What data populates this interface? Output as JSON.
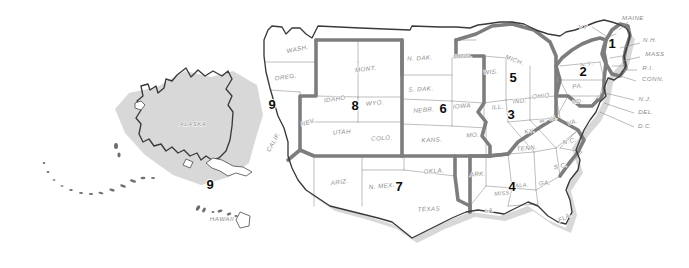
{
  "map": {
    "title": "United States Federal Regions Map",
    "background_color": "#ffffff",
    "region_boundary_color": "#7d7d7d",
    "state_border_color": "#9a9a9a",
    "coast_outline_color": "#3a3a3a",
    "label_color": "#8c8c8c",
    "number_color": "#0d0d0d",
    "lake_color": "#e3e3e3",
    "shadow_color": "#c9c9c9"
  },
  "regions": [
    {
      "number": "1",
      "x": 612,
      "y": 48,
      "states": [
        "MAINE",
        "VT",
        "N.H.",
        "MASS",
        "R.I.",
        "CONN."
      ]
    },
    {
      "number": "2",
      "x": 583,
      "y": 76,
      "states": [
        "N.Y.",
        "PA.",
        "N.J.",
        "DEL.",
        "MD."
      ]
    },
    {
      "number": "3",
      "x": 511,
      "y": 119,
      "states": [
        "W.VA.",
        "VA.",
        "KY.",
        "TENN.",
        "N.C.",
        "D.C."
      ]
    },
    {
      "number": "4",
      "x": 512,
      "y": 191,
      "states": [
        "ALA.",
        "MISS.",
        "GA.",
        "S.C.",
        "FLA.",
        "LA."
      ]
    },
    {
      "number": "5",
      "x": 513,
      "y": 82,
      "states": [
        "MICH.",
        "WIS.",
        "ILL.",
        "IND.",
        "OHIO"
      ]
    },
    {
      "number": "6",
      "x": 443,
      "y": 113,
      "states": [
        "MINN.",
        "N. DAK.",
        "S. DAK.",
        "NEBR.",
        "IOWA",
        "KANS.",
        "MO."
      ]
    },
    {
      "number": "7",
      "x": 399,
      "y": 191,
      "states": [
        "ARIZ.",
        "N. MEX.",
        "OKLA.",
        "TEXAS"
      ]
    },
    {
      "number": "8",
      "x": 355,
      "y": 110,
      "states": [
        "IDAHO",
        "WYO.",
        "NEV.",
        "UTAH",
        "COLO."
      ]
    },
    {
      "number": "9",
      "x": 272,
      "y": 109,
      "states": [
        "WASH.",
        "OREG.",
        "CALIF."
      ]
    },
    {
      "number": "9",
      "x": 210,
      "y": 189,
      "states": [
        "ALASKA",
        "HAWAII"
      ]
    }
  ],
  "state_labels": [
    {
      "text": "ALASKA",
      "x": 193,
      "y": 126,
      "rot": 0,
      "size": "normal"
    },
    {
      "text": "HAWAII",
      "x": 222,
      "y": 221,
      "rot": 0,
      "size": "normal"
    },
    {
      "text": "WASH.",
      "x": 298,
      "y": 51,
      "rot": -12,
      "size": "normal"
    },
    {
      "text": "OREG.",
      "x": 286,
      "y": 79,
      "rot": -8,
      "size": "normal"
    },
    {
      "text": "CALIF.",
      "x": 275,
      "y": 143,
      "rot": -60,
      "size": "normal"
    },
    {
      "text": "NEV.",
      "x": 309,
      "y": 124,
      "rot": -18,
      "size": "normal"
    },
    {
      "text": "IDAHO",
      "x": 335,
      "y": 101,
      "rot": -8,
      "size": "normal"
    },
    {
      "text": "MONT.",
      "x": 366,
      "y": 71,
      "rot": -6,
      "size": "normal"
    },
    {
      "text": "WYO.",
      "x": 375,
      "y": 105,
      "rot": -5,
      "size": "normal"
    },
    {
      "text": "UTAH",
      "x": 342,
      "y": 134,
      "rot": -5,
      "size": "normal"
    },
    {
      "text": "COLO.",
      "x": 382,
      "y": 140,
      "rot": -4,
      "size": "normal"
    },
    {
      "text": "ARIZ.",
      "x": 340,
      "y": 184,
      "rot": -8,
      "size": "normal"
    },
    {
      "text": "N. MEX.",
      "x": 382,
      "y": 188,
      "rot": -5,
      "size": "normal"
    },
    {
      "text": "TEXAS",
      "x": 429,
      "y": 211,
      "rot": -3,
      "size": "normal"
    },
    {
      "text": "OKLA.",
      "x": 434,
      "y": 173,
      "rot": -4,
      "size": "normal"
    },
    {
      "text": "KANS.",
      "x": 432,
      "y": 142,
      "rot": -3,
      "size": "normal"
    },
    {
      "text": "NEBR.",
      "x": 424,
      "y": 112,
      "rot": -4,
      "size": "normal"
    },
    {
      "text": "S. DAK.",
      "x": 421,
      "y": 91,
      "rot": -3,
      "size": "normal"
    },
    {
      "text": "N. DAK.",
      "x": 420,
      "y": 60,
      "rot": -3,
      "size": "normal"
    },
    {
      "text": "MINN.",
      "x": 463,
      "y": 58,
      "rot": -4,
      "size": "normal"
    },
    {
      "text": "IOWA",
      "x": 462,
      "y": 108,
      "rot": -4,
      "size": "normal"
    },
    {
      "text": "MO.",
      "x": 473,
      "y": 137,
      "rot": -4,
      "size": "normal"
    },
    {
      "text": "WIS.",
      "x": 491,
      "y": 74,
      "rot": -4,
      "size": "normal"
    },
    {
      "text": "MICH.",
      "x": 514,
      "y": 62,
      "rot": 22,
      "size": "normal"
    },
    {
      "text": "ILL.",
      "x": 498,
      "y": 109,
      "rot": -5,
      "size": "normal"
    },
    {
      "text": "IND.",
      "x": 520,
      "y": 103,
      "rot": -5,
      "size": "normal"
    },
    {
      "text": "OHIO",
      "x": 541,
      "y": 98,
      "rot": -5,
      "size": "normal"
    },
    {
      "text": "ARK.",
      "x": 478,
      "y": 176,
      "rot": -5,
      "size": "normal"
    },
    {
      "text": "LA.",
      "x": 490,
      "y": 212,
      "rot": -5,
      "size": "sm"
    },
    {
      "text": "MISS.",
      "x": 503,
      "y": 195,
      "rot": -5,
      "size": "sm"
    },
    {
      "text": "ALA.",
      "x": 522,
      "y": 187,
      "rot": -5,
      "size": "sm"
    },
    {
      "text": "GA.",
      "x": 545,
      "y": 185,
      "rot": -5,
      "size": "normal"
    },
    {
      "text": "S.C.",
      "x": 561,
      "y": 168,
      "rot": -12,
      "size": "normal"
    },
    {
      "text": "FLA.",
      "x": 566,
      "y": 219,
      "rot": -28,
      "size": "normal"
    },
    {
      "text": "TENN.",
      "x": 527,
      "y": 150,
      "rot": -5,
      "size": "normal"
    },
    {
      "text": "KY.",
      "x": 530,
      "y": 133,
      "rot": -10,
      "size": "normal"
    },
    {
      "text": "N.C.",
      "x": 570,
      "y": 143,
      "rot": -12,
      "size": "normal"
    },
    {
      "text": "VA.",
      "x": 573,
      "y": 124,
      "rot": -14,
      "size": "normal"
    },
    {
      "text": "W. VA.",
      "x": 549,
      "y": 121,
      "rot": -14,
      "size": "sm"
    },
    {
      "text": "PA.",
      "x": 578,
      "y": 88,
      "rot": -8,
      "size": "normal"
    },
    {
      "text": "N.Y.",
      "x": 587,
      "y": 66,
      "rot": -10,
      "size": "normal"
    },
    {
      "text": "MD.",
      "x": 578,
      "y": 103,
      "rot": -12,
      "size": "sm"
    }
  ],
  "callout_labels": [
    {
      "text": "VT",
      "x": 583,
      "y": 29,
      "lx1": 592,
      "ly1": 27,
      "lx2": 606,
      "ly2": 36
    },
    {
      "text": "MAINE",
      "x": 633,
      "y": 20,
      "lx1": 628,
      "ly1": 22,
      "lx2": 619,
      "ly2": 30
    },
    {
      "text": "N.H.",
      "x": 650,
      "y": 42,
      "lx1": 640,
      "ly1": 43,
      "lx2": 620,
      "ly2": 48
    },
    {
      "text": "MASS",
      "x": 655,
      "y": 56,
      "lx1": 640,
      "ly1": 57,
      "lx2": 622,
      "ly2": 61
    },
    {
      "text": "R.I.",
      "x": 648,
      "y": 70,
      "lx1": 637,
      "ly1": 70,
      "lx2": 623,
      "ly2": 70
    },
    {
      "text": "CONN.",
      "x": 653,
      "y": 81,
      "lx1": 636,
      "ly1": 81,
      "lx2": 620,
      "ly2": 76
    },
    {
      "text": "N.J.",
      "x": 645,
      "y": 101,
      "lx1": 634,
      "ly1": 100,
      "lx2": 605,
      "ly2": 93
    },
    {
      "text": "DEL.",
      "x": 646,
      "y": 114,
      "lx1": 634,
      "ly1": 113,
      "lx2": 604,
      "ly2": 103
    },
    {
      "text": "D.C.",
      "x": 645,
      "y": 128,
      "lx1": 634,
      "ly1": 127,
      "lx2": 600,
      "ly2": 112
    }
  ]
}
